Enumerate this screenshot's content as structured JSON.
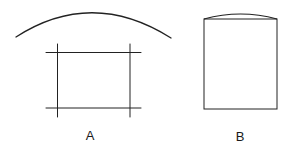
{
  "diagram": {
    "stroke_color": "#222222",
    "figures": [
      {
        "id": "A",
        "label": "A",
        "description": "Arc above a rectangle formed by crossing lines"
      },
      {
        "id": "B",
        "label": "B",
        "description": "Rectangle with slightly curved top edge"
      }
    ]
  }
}
